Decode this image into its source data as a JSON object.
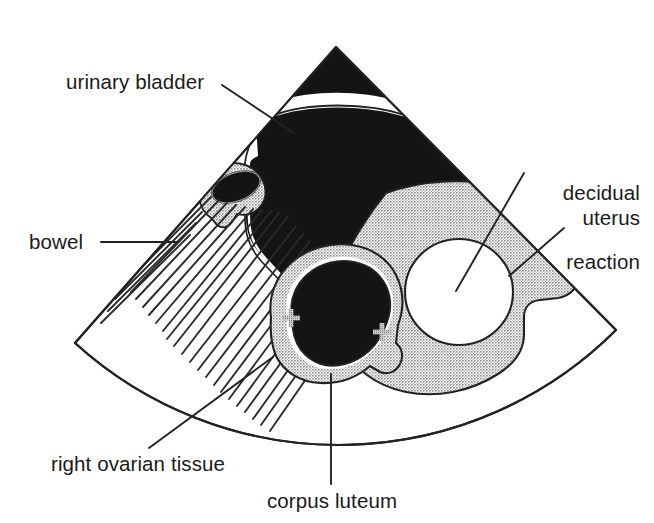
{
  "figure": {
    "kind": "labelled-ultrasound-sector-diagram",
    "modality_shape": "sector-scan-fan",
    "outline_color": "#222222",
    "background_color": "#ffffff"
  },
  "palette": {
    "anechoic_black": "#141414",
    "stipple_gray": "#a8a8a8",
    "stipple_gray_dark": "#8f8f8f",
    "white_fill": "#ffffff",
    "line_black": "#222222",
    "text_black": "#1a1a1a",
    "marker_gray": "#9a9a9a"
  },
  "labels": [
    {
      "id": "urinary-bladder",
      "text": "urinary bladder",
      "align": "left",
      "x": 66,
      "y": 70,
      "leader": {
        "x1": 222,
        "y1": 85,
        "x2": 294,
        "y2": 133
      }
    },
    {
      "id": "decidual-reaction",
      "text": "decidual\nreaction",
      "line_1": "decidual",
      "line_2": "reaction",
      "align": "right",
      "x": 494,
      "y": 135,
      "leader": {
        "x1": 524,
        "y1": 173,
        "x2": 456,
        "y2": 291
      }
    },
    {
      "id": "uterus",
      "text": "uterus",
      "align": "right",
      "x": 566,
      "y": 206,
      "leader": {
        "x1": 564,
        "y1": 228,
        "x2": 509,
        "y2": 276
      }
    },
    {
      "id": "bowel",
      "text": "bowel",
      "align": "left",
      "x": 29,
      "y": 230,
      "leader": {
        "x1": 101,
        "y1": 242,
        "x2": 177,
        "y2": 242
      }
    },
    {
      "id": "right-ovarian-tissue",
      "text": "right ovarian tissue",
      "align": "left",
      "x": 51,
      "y": 452,
      "leader": {
        "x1": 149,
        "y1": 448,
        "x2": 273,
        "y2": 357
      }
    },
    {
      "id": "corpus-luteum",
      "text": "corpus luteum",
      "align": "left",
      "x": 267,
      "y": 489,
      "leader": {
        "x1": 331,
        "y1": 484,
        "x2": 331,
        "y2": 374
      }
    }
  ],
  "structures": [
    {
      "id": "scan-sector",
      "name": "ultrasound sector outline",
      "fill": "#ffffff",
      "stroke": "#222222"
    },
    {
      "id": "urinary-bladder-region",
      "name": "urinary bladder (anechoic)",
      "fill": "#141414"
    },
    {
      "id": "bladder-near-field-band",
      "name": "near-field white band",
      "fill": "#ffffff"
    },
    {
      "id": "uterus-region",
      "name": "uterus myometrium (stippled)",
      "fill": "#a8a8a8"
    },
    {
      "id": "decidual-cavity",
      "name": "decidual reaction / gestational sac",
      "fill": "#ffffff"
    },
    {
      "id": "corpus-luteum-rim",
      "name": "right ovarian tissue rim (stippled)",
      "fill": "#a8a8a8"
    },
    {
      "id": "corpus-luteum-core",
      "name": "corpus luteum cyst (anechoic)",
      "fill": "#141414"
    },
    {
      "id": "bowel-region",
      "name": "bowel (hatched shadowing)",
      "fill": "#ffffff"
    },
    {
      "id": "accessory-gray-structure",
      "name": "small stippled structure with anechoic oval",
      "fill": "#a8a8a8"
    },
    {
      "id": "caliper-markers",
      "name": "measurement caliper crosses",
      "count": 2,
      "fill": "#9a9a9a"
    }
  ],
  "geometry": {
    "apex": {
      "x": 336,
      "y": 47
    },
    "left_corner": {
      "x": 75,
      "y": 343
    },
    "right_corner": {
      "x": 616,
      "y": 330
    },
    "arc_bottom": {
      "x": 332,
      "y": 437
    }
  }
}
